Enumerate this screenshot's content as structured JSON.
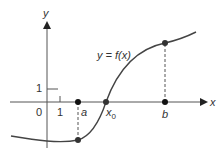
{
  "diagram": {
    "axes": {
      "x_label": "x",
      "y_label": "y"
    },
    "ticks": {
      "origin": "0",
      "x_one": "1",
      "y_one": "1"
    },
    "curve_label": "y = f(x)",
    "points": {
      "a": "a",
      "x0": "x",
      "x0_sub": "0",
      "b": "b"
    },
    "colors": {
      "axis": "#444444",
      "curve": "#444444",
      "point": "#111111"
    }
  }
}
